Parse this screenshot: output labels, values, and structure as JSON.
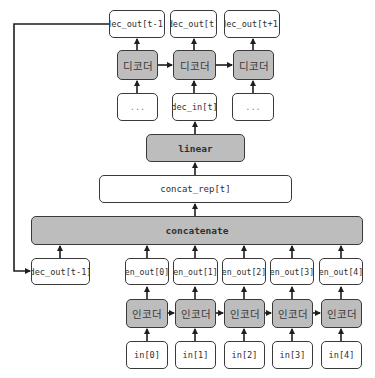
{
  "decoder_section": {
    "outputs": [
      "dec_out[t-1]",
      "dec_out[t]",
      "dec_out[t+1]"
    ],
    "decoders": [
      "디코더",
      "디코더",
      "디코더"
    ],
    "inputs": [
      "...",
      "dec_in[t]",
      "..."
    ]
  },
  "linear_label": "linear",
  "concat_rep_label": "concat_rep[t]",
  "concatenate_label": "concatenate",
  "feedback_label": "dec_out[t-1]",
  "encoder_section": {
    "outputs": [
      "en_out[0]",
      "en_out[1]",
      "en_out[2]",
      "en_out[3]",
      "en_out[4]"
    ],
    "encoders": [
      "인코더",
      "인코더",
      "인코더",
      "인코더",
      "인코더"
    ],
    "inputs": [
      "in[0]",
      "in[1]",
      "in[2]",
      "in[3]",
      "in[4]"
    ]
  },
  "colors": {
    "gray_fill": "#bdbdbd",
    "border": "#3a3a3a",
    "text": "#2f2f2f"
  }
}
